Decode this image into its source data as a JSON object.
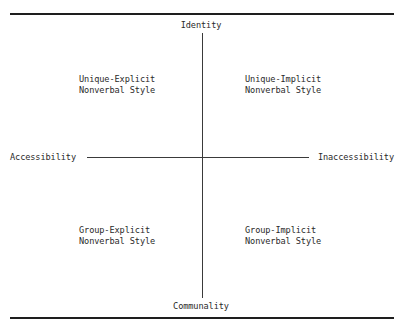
{
  "diagram": {
    "type": "quadrant",
    "axes": {
      "vertical": {
        "top": "Identity",
        "bottom": "Communality"
      },
      "horizontal": {
        "left": "Accessibility",
        "right": "Inaccessibility"
      }
    },
    "quadrants": {
      "upper_left": {
        "line1": "Unique-Explicit",
        "line2": "Nonverbal Style"
      },
      "upper_right": {
        "line1": "Unique-Implicit",
        "line2": "Nonverbal Style"
      },
      "lower_left": {
        "line1": "Group-Explicit",
        "line2": "Nonverbal Style"
      },
      "lower_right": {
        "line1": "Group-Implicit",
        "line2": "Nonverbal Style"
      }
    }
  },
  "colors": {
    "ink": "#2a2a2a",
    "rule": "#1e1e1e",
    "background": "#ffffff"
  }
}
